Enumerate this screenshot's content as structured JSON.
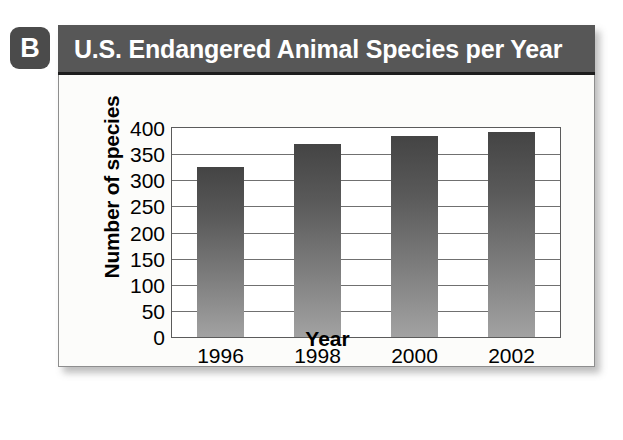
{
  "figure": {
    "badge_letter": "B"
  },
  "panel": {
    "title": "U.S. Endangered Animal Species per Year"
  },
  "chart_data": {
    "type": "bar",
    "title": "U.S. Endangered Animal Species per Year",
    "categories": [
      "1996",
      "1998",
      "2000",
      "2002"
    ],
    "values": [
      325,
      370,
      385,
      393
    ],
    "xlabel": "Year",
    "ylabel": "Number of species",
    "ylim": [
      0,
      400
    ],
    "ytick_step": 50,
    "yticks": [
      "400",
      "350",
      "300",
      "250",
      "200",
      "150",
      "100",
      "50",
      "0"
    ],
    "ytick_values": [
      400,
      350,
      300,
      250,
      200,
      150,
      100,
      50,
      0
    ],
    "grid": "horizontal",
    "legend": "none",
    "bar_color_top": "#444444",
    "bar_color_bottom": "#a2a2a2",
    "title_bar_color": "#575757",
    "panel_background": "#fcfcfa"
  }
}
